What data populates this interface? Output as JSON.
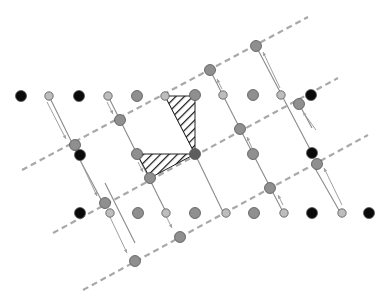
{
  "diagram": {
    "type": "crystal-lattice-shear-structure",
    "colors": {
      "background": "#ffffff",
      "dashed_line": "#a8a8a8",
      "bond": "#8a8a8a",
      "arrow": "#a0a0a0",
      "atom_black": "#0a0a0a",
      "atom_gray": "#8f8f8f",
      "atom_dark_gray": "#5e5e5e",
      "atom_light": "#bdbdbd",
      "hatch": "#111111"
    },
    "dashed_lines": [
      {
        "x1": 22,
        "y1": 170,
        "x2": 308,
        "y2": 17
      },
      {
        "x1": 53,
        "y1": 233,
        "x2": 338,
        "y2": 78
      },
      {
        "x1": 83,
        "y1": 290,
        "x2": 368,
        "y2": 135
      }
    ],
    "bonds": [
      {
        "x1": 108,
        "y1": 96,
        "x2": 165,
        "y2": 210
      },
      {
        "x1": 165,
        "y1": 96,
        "x2": 195,
        "y2": 154
      },
      {
        "x1": 195,
        "y1": 154,
        "x2": 223,
        "y2": 212
      },
      {
        "x1": 210,
        "y1": 70,
        "x2": 253,
        "y2": 154
      },
      {
        "x1": 253,
        "y1": 154,
        "x2": 283,
        "y2": 212
      },
      {
        "x1": 49,
        "y1": 96,
        "x2": 78,
        "y2": 155
      },
      {
        "x1": 78,
        "y1": 155,
        "x2": 80,
        "y2": 160
      },
      {
        "x1": 256,
        "y1": 46,
        "x2": 312,
        "y2": 153
      },
      {
        "x1": 299,
        "y1": 104,
        "x2": 312,
        "y2": 128
      },
      {
        "x1": 105,
        "y1": 183,
        "x2": 135,
        "y2": 243
      },
      {
        "x1": 80,
        "y1": 160,
        "x2": 105,
        "y2": 207
      },
      {
        "x1": 312,
        "y1": 163,
        "x2": 340,
        "y2": 212
      }
    ],
    "arrows": [
      {
        "x1": 47,
        "y1": 102,
        "x2": 66,
        "y2": 139
      },
      {
        "x1": 107,
        "y1": 102,
        "x2": 113,
        "y2": 114
      },
      {
        "x1": 80,
        "y1": 160,
        "x2": 97,
        "y2": 196
      },
      {
        "x1": 109,
        "y1": 215,
        "x2": 127,
        "y2": 253
      },
      {
        "x1": 138,
        "y1": 162,
        "x2": 143,
        "y2": 172
      },
      {
        "x1": 166,
        "y1": 216,
        "x2": 172,
        "y2": 228
      },
      {
        "x1": 222,
        "y1": 89,
        "x2": 217,
        "y2": 79
      },
      {
        "x1": 252,
        "y1": 148,
        "x2": 247,
        "y2": 137
      },
      {
        "x1": 280,
        "y1": 88,
        "x2": 263,
        "y2": 52
      },
      {
        "x1": 283,
        "y1": 205,
        "x2": 278,
        "y2": 195
      },
      {
        "x1": 342,
        "y1": 205,
        "x2": 324,
        "y2": 168
      },
      {
        "x1": 316,
        "y1": 130,
        "x2": 303,
        "y2": 112
      }
    ],
    "hatched_triangles": [
      {
        "points": "165,96 195,96 195,154"
      },
      {
        "points": "137,154 195,154 150,178"
      }
    ],
    "atoms": [
      {
        "x": 21,
        "y": 96,
        "r": 5.5,
        "kind": "black"
      },
      {
        "x": 49,
        "y": 96,
        "r": 4.2,
        "kind": "light"
      },
      {
        "x": 79,
        "y": 96,
        "r": 5.5,
        "kind": "black"
      },
      {
        "x": 108,
        "y": 96,
        "r": 4.2,
        "kind": "light"
      },
      {
        "x": 137,
        "y": 96,
        "r": 5.5,
        "kind": "gray"
      },
      {
        "x": 165,
        "y": 96,
        "r": 4.2,
        "kind": "light"
      },
      {
        "x": 195,
        "y": 95,
        "r": 5.5,
        "kind": "gray"
      },
      {
        "x": 223,
        "y": 95,
        "r": 4.2,
        "kind": "light"
      },
      {
        "x": 253,
        "y": 95,
        "r": 5.5,
        "kind": "gray"
      },
      {
        "x": 281,
        "y": 95,
        "r": 4.2,
        "kind": "light"
      },
      {
        "x": 311,
        "y": 95,
        "r": 5.5,
        "kind": "black"
      },
      {
        "x": 120,
        "y": 120,
        "r": 5.5,
        "kind": "gray"
      },
      {
        "x": 210,
        "y": 70,
        "r": 5.5,
        "kind": "gray"
      },
      {
        "x": 256,
        "y": 46,
        "r": 5.5,
        "kind": "gray"
      },
      {
        "x": 299,
        "y": 104,
        "r": 5.5,
        "kind": "gray"
      },
      {
        "x": 75,
        "y": 145,
        "r": 5.5,
        "kind": "gray"
      },
      {
        "x": 80,
        "y": 155,
        "r": 5.5,
        "kind": "black"
      },
      {
        "x": 137,
        "y": 154,
        "r": 5.5,
        "kind": "gray"
      },
      {
        "x": 195,
        "y": 154,
        "r": 5.5,
        "kind": "dark"
      },
      {
        "x": 240,
        "y": 129,
        "r": 5.5,
        "kind": "gray"
      },
      {
        "x": 253,
        "y": 154,
        "r": 5.5,
        "kind": "gray"
      },
      {
        "x": 312,
        "y": 153,
        "r": 5.5,
        "kind": "black"
      },
      {
        "x": 150,
        "y": 178,
        "r": 5.5,
        "kind": "gray"
      },
      {
        "x": 270,
        "y": 188,
        "r": 5.5,
        "kind": "gray"
      },
      {
        "x": 317,
        "y": 164,
        "r": 5.5,
        "kind": "gray"
      },
      {
        "x": 105,
        "y": 203,
        "r": 5.5,
        "kind": "gray"
      },
      {
        "x": 80,
        "y": 213,
        "r": 5.5,
        "kind": "black"
      },
      {
        "x": 110,
        "y": 213,
        "r": 4.2,
        "kind": "light"
      },
      {
        "x": 138,
        "y": 213,
        "r": 5.5,
        "kind": "gray"
      },
      {
        "x": 166,
        "y": 213,
        "r": 4.2,
        "kind": "light"
      },
      {
        "x": 195,
        "y": 213,
        "r": 5.5,
        "kind": "gray"
      },
      {
        "x": 226,
        "y": 213,
        "r": 4.2,
        "kind": "light"
      },
      {
        "x": 254,
        "y": 213,
        "r": 5.5,
        "kind": "gray"
      },
      {
        "x": 284,
        "y": 213,
        "r": 4.2,
        "kind": "light"
      },
      {
        "x": 312,
        "y": 213,
        "r": 5.5,
        "kind": "black"
      },
      {
        "x": 342,
        "y": 213,
        "r": 4.2,
        "kind": "light"
      },
      {
        "x": 369,
        "y": 213,
        "r": 5.5,
        "kind": "black"
      },
      {
        "x": 180,
        "y": 237,
        "r": 5.5,
        "kind": "gray"
      },
      {
        "x": 135,
        "y": 261,
        "r": 5.5,
        "kind": "gray"
      }
    ]
  }
}
